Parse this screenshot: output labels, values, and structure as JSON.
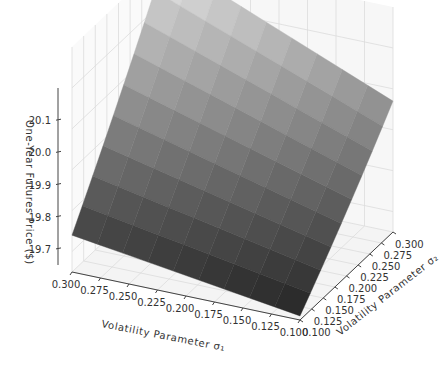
{
  "chart_data": {
    "type": "surface3d",
    "title": "",
    "zlabel": "One-Year Futures Price ($)",
    "xlabel": "Volatility Parameter σ₁",
    "ylabel": "Volatility Parameter σ₂",
    "x_ticks": [
      "0.300",
      "0.275",
      "0.250",
      "0.225",
      "0.200",
      "0.175",
      "0.150",
      "0.125",
      "0.100"
    ],
    "y_ticks": [
      "0.100",
      "0.125",
      "0.150",
      "0.175",
      "0.200",
      "0.225",
      "0.250",
      "0.275",
      "0.300"
    ],
    "z_ticks": [
      "19.7",
      "19.8",
      "19.9",
      "20.0",
      "20.1"
    ],
    "xlim": [
      0.1,
      0.3
    ],
    "ylim": [
      0.1,
      0.3
    ],
    "zlim": [
      19.65,
      20.2
    ],
    "grid": true,
    "colormap": "gray",
    "grid_resolution": 9,
    "corner_values": {
      "sigma1_0.30_sigma2_0.10": 19.74,
      "sigma1_0.10_sigma2_0.10": 19.66,
      "sigma1_0.10_sigma2_0.30": 19.94,
      "sigma1_0.30_sigma2_0.30": 20.17
    }
  },
  "labels": {
    "z_axis": "One-Year Futures Price ($)",
    "x_axis": "Volatility Parameter σ₁",
    "y_axis": "Volatility Parameter σ₂"
  }
}
